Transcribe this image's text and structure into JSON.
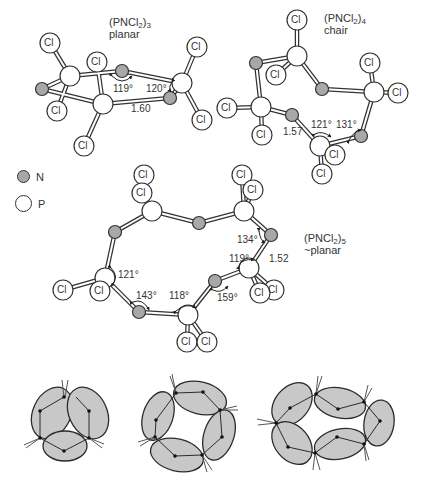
{
  "figure": {
    "colors": {
      "nitrogen": "#a8a8a8",
      "phosphorus": "#ffffff",
      "chlorine": "#ffffff",
      "outline": "#333333",
      "lobe_fill": "#c8c8c8"
    },
    "legend": [
      {
        "symbol": "nitrogen-atom",
        "label": "N"
      },
      {
        "symbol": "phosphorus-atom",
        "label": "P"
      }
    ],
    "atom_label": "Cl",
    "molecules": [
      {
        "id": "trimer",
        "formula_prefix": "(PNCl",
        "formula_sub1": "2",
        "formula_mid": ")",
        "formula_sub2": "3",
        "conformation": "planar",
        "angles": [
          "119°",
          "120°"
        ],
        "bond_length": "1.60"
      },
      {
        "id": "tetramer",
        "formula_prefix": "(PNCl",
        "formula_sub1": "2",
        "formula_mid": ")",
        "formula_sub2": "4",
        "conformation": "chair",
        "angles": [
          "121°",
          "131°"
        ],
        "bond_length": "1.57"
      },
      {
        "id": "pentamer",
        "formula_prefix": "(PNCl",
        "formula_sub1": "2",
        "formula_mid": ")",
        "formula_sub2": "5",
        "conformation": "~planar",
        "angles": [
          "121°",
          "143°",
          "118°",
          "159°",
          "119°",
          "134°"
        ],
        "bond_length": "1.52"
      }
    ],
    "orbital_schematics": [
      {
        "id": "three-island",
        "lobes": 3
      },
      {
        "id": "four-island",
        "lobes": 4
      },
      {
        "id": "five-island",
        "lobes": 5
      }
    ]
  }
}
